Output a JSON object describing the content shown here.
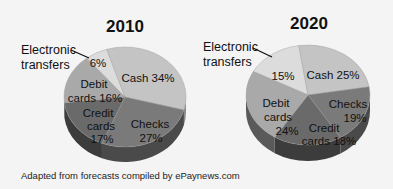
{
  "caption": "Adapted from forecasts compiled by ePaynews.com",
  "chart_data": [
    {
      "type": "pie",
      "title": "2010",
      "categories": [
        "Electronic transfers",
        "Cash",
        "Checks",
        "Credit cards",
        "Debit cards"
      ],
      "values": [
        6,
        34,
        27,
        17,
        16
      ],
      "unit": "%",
      "labels": [
        "6%",
        "Cash 34%",
        "Checks 27%",
        "Credit cards 17%",
        "Debit cards 16%"
      ],
      "callout": "Electronic transfers",
      "style": "3d"
    },
    {
      "type": "pie",
      "title": "2020",
      "categories": [
        "Electronic transfers",
        "Cash",
        "Checks",
        "Credit cards",
        "Debit cards"
      ],
      "values": [
        15,
        25,
        19,
        18,
        24
      ],
      "unit": "%",
      "labels": [
        "15%",
        "Cash 25%",
        "Checks 19%",
        "Credit cards 18%",
        "Debit cards 24%"
      ],
      "callout": "Electronic transfers",
      "style": "3d"
    }
  ],
  "pies": [
    {
      "title": "2010",
      "callout_line1": "Electronic",
      "callout_line2": "transfers",
      "labels": {
        "electronic": "6%",
        "cash": "Cash 34%",
        "checks_1": "Checks",
        "checks_2": "27%",
        "credit_1": "Credit",
        "credit_2": "cards",
        "credit_3": "17%",
        "debit_1": "Debit",
        "debit_2": "cards 16%"
      }
    },
    {
      "title": "2020",
      "callout_line1": "Electronic",
      "callout_line2": "transfers",
      "labels": {
        "electronic": "15%",
        "cash": "Cash 25%",
        "checks_1": "Checks",
        "checks_2": "19%",
        "credit_1": "Credit",
        "credit_2": "cards 18%",
        "debit_1": "Debit",
        "debit_2": "cards",
        "debit_3": "24%"
      }
    }
  ],
  "colors": {
    "electronic": "#dcdcdc",
    "cash": "#c4c4c4",
    "checks": "#7a7a7a",
    "credit": "#6a6a6a",
    "debit": "#a9a9a9",
    "side_checks": "#4a4a4a",
    "side_credit": "#3c3c3c",
    "side_debit": "#5a5a5a",
    "side_cash": "#8a8a8a",
    "background": "#f4f4f4"
  }
}
